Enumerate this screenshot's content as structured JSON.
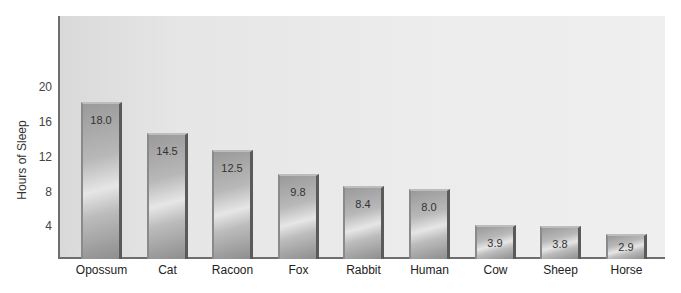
{
  "chart_data": {
    "type": "bar",
    "title": "",
    "xlabel": "",
    "ylabel": "Hours of Sleep",
    "ylim": [
      0,
      24
    ],
    "yticks": [
      4,
      8,
      12,
      16,
      20
    ],
    "grid": false,
    "legend": null,
    "categories": [
      "Opossum",
      "Cat",
      "Racoon",
      "Fox",
      "Rabbit",
      "Human",
      "Cow",
      "Sheep",
      "Horse"
    ],
    "values": [
      18.0,
      14.5,
      12.5,
      9.8,
      8.4,
      8.0,
      3.9,
      3.8,
      2.9
    ],
    "value_labels": [
      "18.0",
      "14.5",
      "12.5",
      "9.8",
      "8.4",
      "8.0",
      "3.9",
      "3.8",
      "2.9"
    ]
  },
  "axis": {
    "ylabel": "Hours of Sleep",
    "ticks": [
      "20",
      "16",
      "12",
      "8",
      "4"
    ]
  },
  "colors": {
    "background": "#ececec",
    "axis": "#6e6e6e",
    "bar": "#b0b0b0"
  }
}
